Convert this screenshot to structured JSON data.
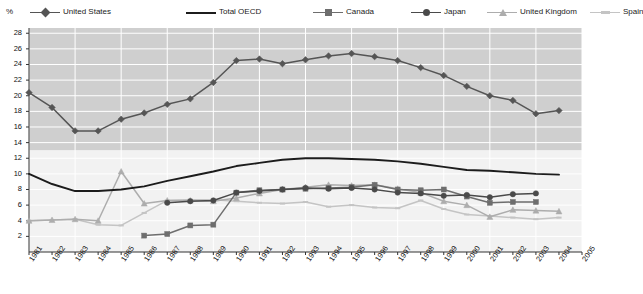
{
  "axis_unit_label": "%",
  "legend": {
    "items": [
      {
        "name": "United States",
        "color": "#555555",
        "marker": "diamond",
        "lw": 1.6
      },
      {
        "name": "Total OECD",
        "color": "#1c1c1c",
        "marker": "none",
        "lw": 2.0
      },
      {
        "name": "Canada",
        "color": "#6e6e6e",
        "marker": "square",
        "lw": 1.6
      },
      {
        "name": "Japan",
        "color": "#4a4a4a",
        "marker": "circle",
        "lw": 1.6
      },
      {
        "name": "United Kingdom",
        "color": "#adadad",
        "marker": "tri",
        "lw": 1.4
      },
      {
        "name": "Spain",
        "color": "#c4c4c4",
        "marker": "dash",
        "lw": 1.4
      }
    ]
  },
  "chart_data": {
    "type": "line",
    "title": "",
    "subtitle": "",
    "xlabel": "",
    "ylabel": "%",
    "ylim": [
      0,
      28.67
    ],
    "yticks": [
      2,
      4,
      6,
      8,
      10,
      12,
      14,
      16,
      18,
      20,
      22,
      24,
      26,
      28
    ],
    "xlim": [
      1981,
      2005
    ],
    "xticks": [
      1981,
      1982,
      1983,
      1984,
      1985,
      1986,
      1987,
      1988,
      1989,
      1990,
      1991,
      1992,
      1993,
      1994,
      1995,
      1996,
      1997,
      1998,
      1999,
      2000,
      2001,
      2002,
      2003,
      2004,
      2005
    ],
    "categories": [
      1981,
      1982,
      1983,
      1984,
      1985,
      1986,
      1987,
      1988,
      1989,
      1990,
      1991,
      1992,
      1993,
      1994,
      1995,
      1996,
      1997,
      1998,
      1999,
      2000,
      2001,
      2002,
      2003,
      2004,
      2005
    ],
    "grid": true,
    "legend_position": "top",
    "series": [
      {
        "name": "United States",
        "color": "#555555",
        "marker": "diamond",
        "x": [
          1981,
          1982,
          1983,
          1984,
          1985,
          1986,
          1987,
          1988,
          1989,
          1990,
          1991,
          1992,
          1993,
          1994,
          1995,
          1996,
          1997,
          1998,
          1999,
          2000,
          2001,
          2002,
          2003,
          2004
        ],
        "values": [
          20.4,
          18.5,
          15.5,
          15.5,
          17.0,
          17.8,
          18.9,
          19.6,
          21.7,
          24.5,
          24.7,
          24.1,
          24.6,
          25.1,
          25.4,
          25.0,
          24.5,
          23.6,
          22.6,
          21.2,
          20.0,
          19.4,
          17.7,
          18.1
        ]
      },
      {
        "name": "Total OECD",
        "color": "#1c1c1c",
        "marker": "none",
        "x": [
          1981,
          1982,
          1983,
          1984,
          1985,
          1986,
          1987,
          1988,
          1989,
          1990,
          1991,
          1992,
          1993,
          1994,
          1995,
          1996,
          1997,
          1998,
          1999,
          2000,
          2001,
          2002,
          2003,
          2004
        ],
        "values": [
          10.0,
          8.7,
          7.8,
          7.8,
          8.0,
          8.4,
          9.1,
          9.7,
          10.3,
          11.0,
          11.4,
          11.8,
          12.0,
          12.0,
          11.9,
          11.8,
          11.6,
          11.3,
          10.9,
          10.5,
          10.4,
          10.2,
          10.0,
          9.9
        ]
      },
      {
        "name": "Canada",
        "color": "#6e6e6e",
        "marker": "square",
        "x": [
          1986,
          1987,
          1988,
          1989,
          1990,
          1991,
          1992,
          1993,
          1994,
          1995,
          1996,
          1997,
          1998,
          1999,
          2000,
          2001,
          2002,
          2003
        ],
        "values": [
          2.1,
          2.3,
          3.4,
          3.5,
          7.6,
          7.9,
          8.0,
          8.1,
          8.2,
          8.3,
          8.6,
          8.0,
          7.9,
          8.0,
          7.1,
          6.3,
          6.4,
          6.4
        ]
      },
      {
        "name": "Japan",
        "color": "#4a4a4a",
        "marker": "circle",
        "x": [
          1987,
          1988,
          1989,
          1990,
          1991,
          1992,
          1993,
          1994,
          1995,
          1996,
          1997,
          1998,
          1999,
          2000,
          2001,
          2002,
          2003
        ],
        "values": [
          6.3,
          6.5,
          6.6,
          7.6,
          7.8,
          8.0,
          8.2,
          8.1,
          8.2,
          8.0,
          7.6,
          7.5,
          7.2,
          7.3,
          7.0,
          7.4,
          7.5
        ]
      },
      {
        "name": "United Kingdom",
        "color": "#adadad",
        "marker": "tri",
        "x": [
          1981,
          1982,
          1983,
          1984,
          1985,
          1986,
          1987,
          1988,
          1989,
          1990,
          1991,
          1992,
          1993,
          1994,
          1995,
          1996,
          1997,
          1998,
          1999,
          2000,
          2001,
          2002,
          2003,
          2004
        ],
        "values": [
          4.0,
          4.1,
          4.2,
          4.0,
          10.3,
          6.2,
          6.6,
          6.6,
          6.5,
          6.9,
          7.5,
          8.0,
          8.3,
          8.6,
          8.5,
          8.6,
          8.1,
          7.6,
          6.5,
          6.0,
          4.5,
          5.4,
          5.3,
          5.2
        ]
      },
      {
        "name": "Spain",
        "color": "#c4c4c4",
        "marker": "dash",
        "x": [
          1981,
          1982,
          1983,
          1984,
          1985,
          1986,
          1987,
          1988,
          1989,
          1990,
          1991,
          1992,
          1993,
          1994,
          1995,
          1996,
          1997,
          1998,
          1999,
          2000,
          2001,
          2002,
          2003,
          2004
        ],
        "values": [
          4.0,
          4.1,
          4.2,
          3.5,
          3.4,
          5.0,
          6.6,
          6.7,
          6.7,
          6.5,
          6.3,
          6.2,
          6.4,
          5.8,
          6.0,
          5.7,
          5.6,
          6.6,
          5.5,
          4.8,
          4.6,
          4.4,
          4.2,
          4.4
        ]
      }
    ]
  }
}
